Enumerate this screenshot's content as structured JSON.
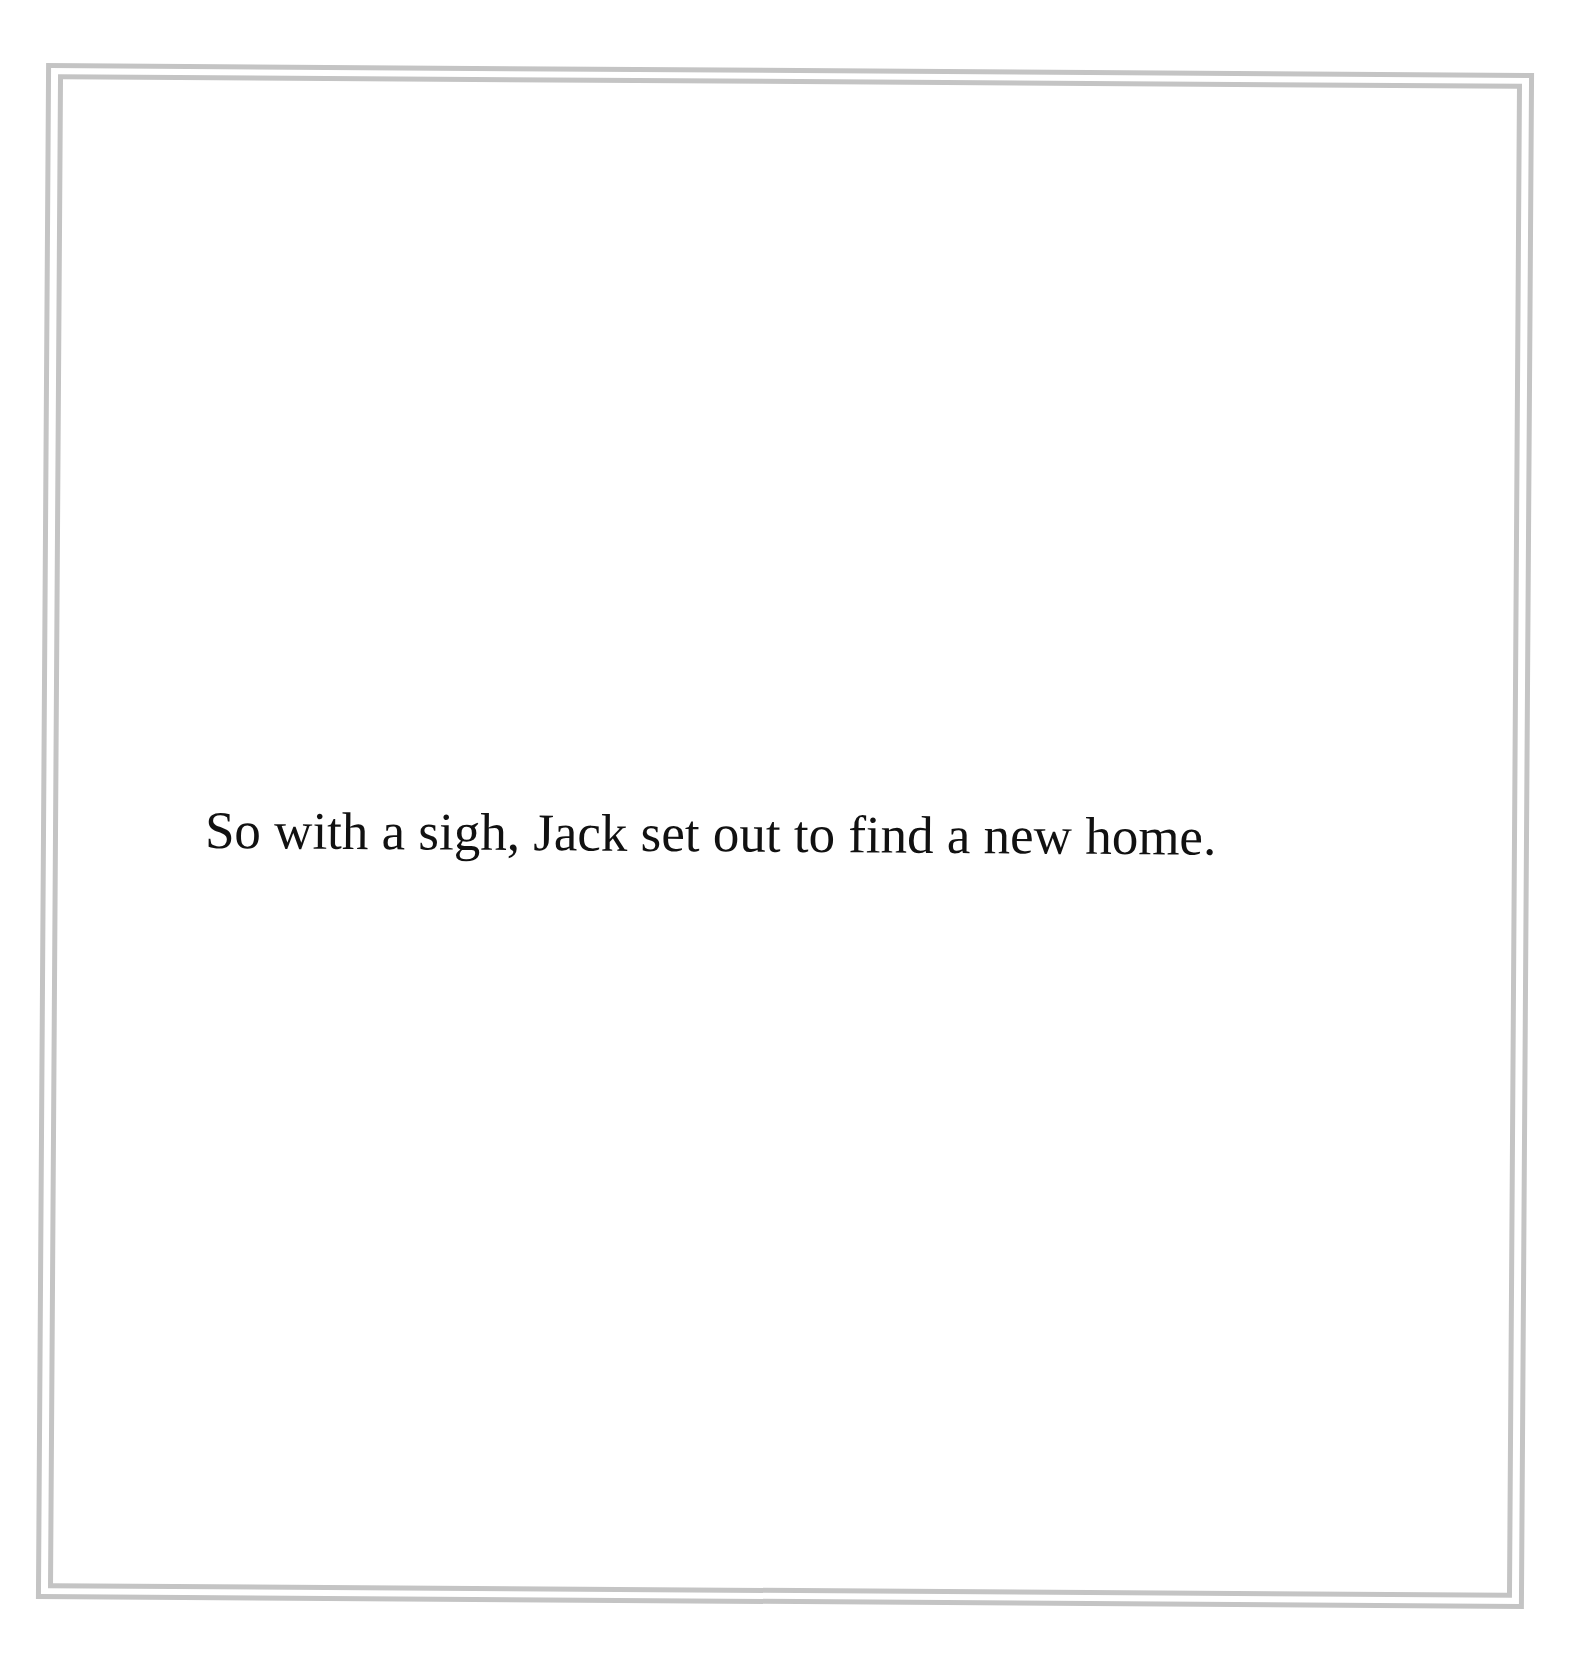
{
  "page": {
    "background_color": "#ffffff",
    "border_color": "#c4c4c4",
    "text_color": "#111111",
    "text": "So with a sigh, Jack set out to find a new home."
  }
}
